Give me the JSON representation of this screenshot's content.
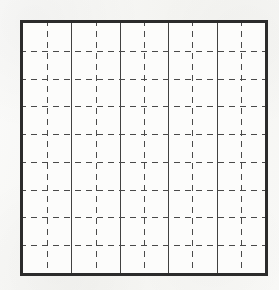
{
  "figure": {
    "kind": "grid-figure",
    "canvas": {
      "width": 279,
      "height": 290,
      "background_color": "#f7f7f5"
    },
    "box": {
      "left": 20,
      "top": 20,
      "width": 248,
      "height": 256,
      "fill_color": "#fcfcfb",
      "border_color": "#2b2b2b",
      "border_width": 3
    },
    "grid": {
      "columns": 10,
      "rows": 9,
      "cell_width": 24.2,
      "cell_height": 27.8,
      "solid_line_color": "#414141",
      "solid_line_width": 1,
      "dashed_line_color": "#4a4a4a",
      "dashed_line_width": 1,
      "dash_length": 6,
      "dash_gap": 5,
      "horizontal_line_style": "dashed",
      "vertical_solid_every_n_columns": 2
    },
    "vertical_solid_positions": [
      48.4,
      96.8,
      145.2,
      193.6
    ],
    "vertical_dashed_positions": [
      24.2,
      72.6,
      121.0,
      169.4,
      217.8
    ],
    "horizontal_dashed_positions": [
      27.8,
      55.6,
      83.3,
      111.1,
      138.9,
      166.7,
      194.4,
      222.2
    ]
  }
}
